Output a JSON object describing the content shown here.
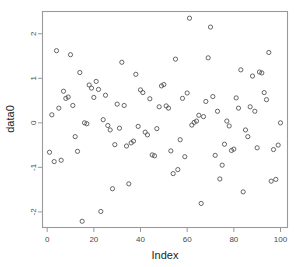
{
  "figure": {
    "title": "",
    "background_color": "#ffffff",
    "frame_color": "#9a9a9a",
    "point_color": "#555555"
  },
  "axes": {
    "x_title": "Index",
    "y_title": "data0",
    "x_ticks": [
      "0",
      "20",
      "40",
      "60",
      "80",
      "100"
    ],
    "y_ticks": [
      "2",
      "1",
      "0",
      "-1",
      "-2"
    ]
  },
  "chart_data": {
    "type": "scatter",
    "title": "",
    "xlabel": "Index",
    "ylabel": "data0",
    "xlim": [
      -2,
      103
    ],
    "ylim": [
      -2.35,
      2.5
    ],
    "xticks": [
      0,
      20,
      40,
      60,
      80,
      100
    ],
    "yticks": [
      -2,
      -1,
      0,
      1,
      2
    ],
    "grid": false,
    "legend": null,
    "marker": "open-circle",
    "series": [
      {
        "name": "data0",
        "x": [
          1,
          2,
          3,
          4,
          5,
          6,
          7,
          8,
          9,
          10,
          11,
          12,
          13,
          14,
          15,
          16,
          17,
          18,
          19,
          20,
          21,
          22,
          23,
          24,
          25,
          26,
          27,
          28,
          29,
          30,
          31,
          32,
          33,
          34,
          35,
          36,
          37,
          38,
          39,
          40,
          41,
          42,
          43,
          44,
          45,
          46,
          47,
          48,
          49,
          50,
          51,
          52,
          53,
          54,
          55,
          56,
          57,
          58,
          59,
          60,
          61,
          62,
          63,
          64,
          65,
          66,
          67,
          68,
          69,
          70,
          71,
          72,
          73,
          74,
          75,
          76,
          77,
          78,
          79,
          80,
          81,
          82,
          83,
          84,
          85,
          86,
          87,
          88,
          89,
          90,
          91,
          92,
          93,
          94,
          95,
          96,
          97,
          98,
          99,
          100
        ],
        "y": [
          -0.66,
          0.18,
          -0.87,
          1.62,
          0.33,
          -0.84,
          0.71,
          0.55,
          0.58,
          1.53,
          0.39,
          -0.31,
          -0.64,
          1.13,
          -2.21,
          0.0,
          -0.02,
          0.85,
          0.78,
          0.57,
          0.93,
          0.75,
          -1.99,
          0.07,
          0.62,
          -0.06,
          -0.16,
          -1.48,
          -0.49,
          0.42,
          -0.12,
          1.36,
          0.39,
          -0.52,
          -1.37,
          -0.45,
          -0.41,
          1.09,
          -0.08,
          0.74,
          0.68,
          -0.21,
          -0.27,
          0.54,
          -0.72,
          -0.74,
          -0.13,
          0.36,
          0.83,
          0.86,
          0.38,
          0.33,
          -0.63,
          -1.14,
          1.43,
          -1.05,
          -0.38,
          0.55,
          -0.76,
          0.67,
          2.35,
          -0.05,
          0.01,
          0.04,
          0.17,
          -1.81,
          0.14,
          0.48,
          1.46,
          2.15,
          0.59,
          -0.73,
          0.26,
          -1.26,
          -0.95,
          -0.48,
          0.04,
          -0.07,
          -0.62,
          -0.59,
          0.56,
          0.33,
          1.19,
          -1.55,
          -0.16,
          -0.31,
          0.36,
          1.05,
          0.26,
          -0.56,
          1.14,
          1.12,
          0.68,
          0.52,
          1.58,
          -1.31,
          -0.6,
          -1.27,
          -0.5,
          0.0
        ]
      }
    ]
  }
}
